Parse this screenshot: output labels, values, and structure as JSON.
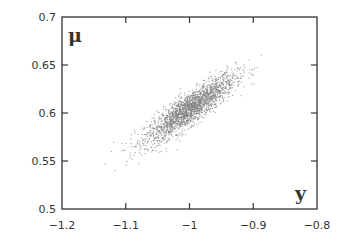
{
  "chart_data": {
    "type": "scatter",
    "title": "",
    "xlabel": "y",
    "ylabel": "μ",
    "xlim": [
      -1.2,
      -0.8
    ],
    "ylim": [
      0.5,
      0.7
    ],
    "xticks": [
      -1.2,
      -1.1,
      -1,
      -0.9,
      -0.8
    ],
    "yticks": [
      0.5,
      0.55,
      0.6,
      0.65,
      0.7
    ],
    "xtick_labels": [
      "-1.2",
      "-1.1",
      "-1",
      "-0.9",
      "-0.8"
    ],
    "ytick_labels": [
      "0.5",
      "0.55",
      "0.6",
      "0.65",
      "0.7"
    ],
    "grid": false,
    "legend": null,
    "point_color": "#808080",
    "series": [
      {
        "name": "samples",
        "description": "Elongated positively correlated cloud of ~2000 points",
        "center": [
          -1.0,
          0.605
        ],
        "x_range": [
          -1.11,
          -0.89
        ],
        "y_range": [
          0.545,
          0.655
        ],
        "correlation": 0.88,
        "n_points": 2000
      }
    ]
  },
  "labels": {
    "x_axis_var": "y",
    "y_axis_var": "μ"
  }
}
